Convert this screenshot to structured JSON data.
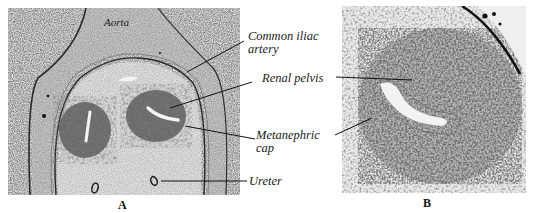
{
  "figure": {
    "panels": [
      {
        "id": "A",
        "letter": "A",
        "description": "Low-power histological section showing the aorta, common iliac arteries, and paired developing metanephric kidneys with ureters"
      },
      {
        "id": "B",
        "letter": "B",
        "description": "Higher-power histological section of a developing metanephros showing the renal pelvis surrounded by the metanephric cap"
      }
    ],
    "inset_label": "Aorta",
    "annotations": [
      {
        "id": "common-iliac-artery",
        "line1": "Common iliac",
        "line2": "artery"
      },
      {
        "id": "renal-pelvis",
        "line1": "Renal pelvis"
      },
      {
        "id": "metanephric-cap",
        "line1": "Metanephric",
        "line2": "cap"
      },
      {
        "id": "ureter",
        "line1": "Ureter"
      }
    ],
    "colors": {
      "background": "#ffffff",
      "tissue_light": "#d9d9d9",
      "tissue_dark": "#3a3a3a",
      "text": "#1a1a1a"
    }
  }
}
